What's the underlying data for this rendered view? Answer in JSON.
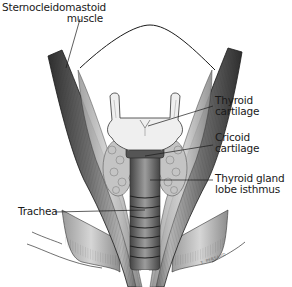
{
  "figure": {
    "labels": [
      {
        "id": "scm",
        "lines": [
          "Sternocleidomastoid",
          "muscle"
        ],
        "align": "right"
      },
      {
        "id": "thyroid_cartilage",
        "lines": [
          "Thyroid",
          "cartilage"
        ],
        "align": "left"
      },
      {
        "id": "cricoid_cartilage",
        "lines": [
          "Cricoid",
          "cartilage"
        ],
        "align": "left"
      },
      {
        "id": "thyroid_gland",
        "lines": [
          "Thyroid gland",
          "lobe isthmus"
        ],
        "align": "left"
      },
      {
        "id": "trachea",
        "lines": [
          "Trachea"
        ],
        "align": "left"
      }
    ],
    "signature": "T. PERSAUD"
  },
  "colors": {
    "ink": "#1a1a1a",
    "muscle_dark": "#3a3a3a",
    "muscle_mid": "#8a8a8a",
    "muscle_light": "#d0d0d0",
    "cartilage": "#eeeeee",
    "gland": "#bdbdbd",
    "background": "#ffffff"
  }
}
